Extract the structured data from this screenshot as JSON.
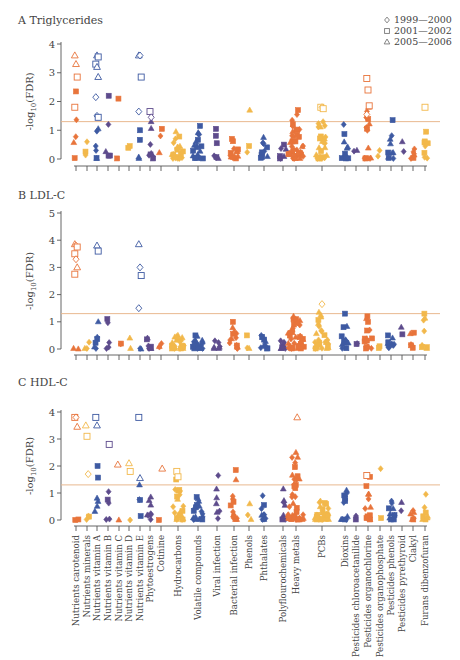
{
  "chart_data": {
    "type": "scatter",
    "subtype": "manhattan-style jitter plot, 3 stacked panels",
    "legend": {
      "position": "top-right",
      "entries": [
        {
          "symbol": "diamond-open",
          "label": "1999—2000"
        },
        {
          "symbol": "square-open",
          "label": "2001—2002"
        },
        {
          "symbol": "triangle-open",
          "label": "2005—2006"
        }
      ],
      "note": "Open symbols = significant (above threshold); filled symbols = non-significant"
    },
    "threshold": {
      "value": 1.3,
      "color": "#e9b98f",
      "label": "FDR 0.05"
    },
    "colors": {
      "orange": "#e8743b",
      "yellow": "#f2b84b",
      "blue": "#3e5aa2",
      "purple": "#5d4b8c"
    },
    "categories": [
      {
        "label": "Nutrients carotenoid",
        "color": "orange"
      },
      {
        "label": "Nutrients minerals",
        "color": "yellow"
      },
      {
        "label": "Nutrients vitamin A",
        "color": "blue"
      },
      {
        "label": "Nutrients vitamin B",
        "color": "purple"
      },
      {
        "label": "Nutrients vitamin C",
        "color": "orange"
      },
      {
        "label": "Nutrients vitamin D",
        "color": "yellow"
      },
      {
        "label": "Nutrients vitamin E",
        "color": "blue"
      },
      {
        "label": "Phytoestrogens",
        "color": "purple"
      },
      {
        "label": "Cotinine",
        "color": "orange"
      },
      {
        "label": "Hydrocarbons",
        "color": "yellow"
      },
      {
        "label": "Volatile compounds",
        "color": "blue"
      },
      {
        "label": "Viral infection",
        "color": "purple"
      },
      {
        "label": "Bacterial infection",
        "color": "orange"
      },
      {
        "label": "Phenols",
        "color": "yellow"
      },
      {
        "label": "Phthalates",
        "color": "blue"
      },
      {
        "label": "Polyflourochemicals",
        "color": "purple"
      },
      {
        "label": "Heavy metals",
        "color": "orange"
      },
      {
        "label": "PCBs",
        "color": "yellow"
      },
      {
        "label": "Dioxins",
        "color": "blue"
      },
      {
        "label": "Pesticides chloroacetanilide",
        "color": "purple"
      },
      {
        "label": "Pesticides organochlorine",
        "color": "orange"
      },
      {
        "label": "Pesticides organophosphate",
        "color": "yellow"
      },
      {
        "label": "Pesticides phenols",
        "color": "blue"
      },
      {
        "label": "Pesticides pyrethyroid",
        "color": "purple"
      },
      {
        "label": "Ciakyl",
        "color": "orange"
      },
      {
        "label": "Furans dibenzofuran",
        "color": "yellow"
      }
    ],
    "panels": [
      {
        "id": "A",
        "title": "Triglycerides",
        "ylabel": "-log10(FDR)",
        "ylim": [
          0,
          4
        ],
        "yticks": [
          0,
          1,
          2,
          3,
          4
        ],
        "significant_points": [
          {
            "cat": 0,
            "y": 3.6,
            "sym": "triangle"
          },
          {
            "cat": 0,
            "y": 3.3,
            "sym": "triangle"
          },
          {
            "cat": 0,
            "y": 2.85,
            "sym": "square"
          },
          {
            "cat": 0,
            "y": 1.8,
            "sym": "square"
          },
          {
            "cat": 2,
            "y": 3.6,
            "sym": "triangle"
          },
          {
            "cat": 2,
            "y": 3.55,
            "sym": "square"
          },
          {
            "cat": 2,
            "y": 3.3,
            "sym": "square"
          },
          {
            "cat": 2,
            "y": 3.2,
            "sym": "triangle"
          },
          {
            "cat": 2,
            "y": 2.85,
            "sym": "triangle"
          },
          {
            "cat": 2,
            "y": 2.15,
            "sym": "diamond"
          },
          {
            "cat": 2,
            "y": 1.5,
            "sym": "diamond"
          },
          {
            "cat": 2,
            "y": 1.45,
            "sym": "square"
          },
          {
            "cat": 6,
            "y": 3.6,
            "sym": "triangle"
          },
          {
            "cat": 6,
            "y": 3.6,
            "sym": "diamond"
          },
          {
            "cat": 6,
            "y": 2.85,
            "sym": "square"
          },
          {
            "cat": 6,
            "y": 1.65,
            "sym": "diamond"
          },
          {
            "cat": 7,
            "y": 1.65,
            "sym": "square"
          },
          {
            "cat": 7,
            "y": 1.45,
            "sym": "diamond"
          },
          {
            "cat": 17,
            "y": 1.8,
            "sym": "square"
          },
          {
            "cat": 17,
            "y": 1.8,
            "sym": "diamond"
          },
          {
            "cat": 17,
            "y": 1.75,
            "sym": "square"
          },
          {
            "cat": 20,
            "y": 2.8,
            "sym": "square"
          },
          {
            "cat": 20,
            "y": 2.4,
            "sym": "square"
          },
          {
            "cat": 20,
            "y": 1.85,
            "sym": "square"
          },
          {
            "cat": 20,
            "y": 1.55,
            "sym": "diamond"
          },
          {
            "cat": 25,
            "y": 1.8,
            "sym": "square"
          }
        ],
        "max_nonsig_by_cat": [
          2.35,
          0.6,
          1.05,
          2.2,
          2.1,
          0.45,
          1.0,
          1.3,
          1.05,
          0.95,
          1.15,
          1.05,
          0.7,
          1.7,
          0.75,
          0.5,
          1.7,
          1.3,
          1.2,
          0.3,
          1.8,
          0.3,
          1.35,
          0.6,
          0.35,
          0.95
        ]
      },
      {
        "id": "B",
        "title": "LDL-C",
        "ylabel": "-log10(FDR)",
        "ylim": [
          0,
          5
        ],
        "yticks": [
          0,
          1,
          2,
          3,
          4,
          5
        ],
        "significant_points": [
          {
            "cat": 0,
            "y": 3.85,
            "sym": "triangle"
          },
          {
            "cat": 0,
            "y": 3.8,
            "sym": "diamond"
          },
          {
            "cat": 0,
            "y": 3.75,
            "sym": "square"
          },
          {
            "cat": 0,
            "y": 3.5,
            "sym": "square"
          },
          {
            "cat": 0,
            "y": 3.3,
            "sym": "diamond"
          },
          {
            "cat": 0,
            "y": 3.0,
            "sym": "triangle"
          },
          {
            "cat": 0,
            "y": 2.75,
            "sym": "square"
          },
          {
            "cat": 2,
            "y": 3.8,
            "sym": "triangle"
          },
          {
            "cat": 2,
            "y": 3.6,
            "sym": "square"
          },
          {
            "cat": 6,
            "y": 3.85,
            "sym": "triangle"
          },
          {
            "cat": 6,
            "y": 3.0,
            "sym": "diamond"
          },
          {
            "cat": 6,
            "y": 2.7,
            "sym": "square"
          },
          {
            "cat": 6,
            "y": 1.5,
            "sym": "diamond"
          },
          {
            "cat": 17,
            "y": 1.65,
            "sym": "diamond"
          }
        ],
        "max_nonsig_by_cat": [
          0,
          0.25,
          1.0,
          1.1,
          0.2,
          0.4,
          0,
          0.4,
          0.2,
          0.5,
          0.5,
          0.3,
          1.0,
          0.5,
          0.5,
          0.3,
          1.2,
          1.35,
          1.3,
          0.2,
          1.2,
          0.1,
          0.5,
          0.8,
          0.6,
          1.3
        ]
      },
      {
        "id": "C",
        "title": "HDL-C",
        "ylabel": "-log10(FDR)",
        "ylim": [
          0,
          4
        ],
        "yticks": [
          0,
          1,
          2,
          3,
          4
        ],
        "significant_points": [
          {
            "cat": 0,
            "y": 3.8,
            "sym": "square"
          },
          {
            "cat": 0,
            "y": 3.8,
            "sym": "diamond"
          },
          {
            "cat": 0,
            "y": 3.45,
            "sym": "triangle"
          },
          {
            "cat": 1,
            "y": 3.5,
            "sym": "triangle"
          },
          {
            "cat": 1,
            "y": 3.1,
            "sym": "square"
          },
          {
            "cat": 1,
            "y": 1.7,
            "sym": "diamond"
          },
          {
            "cat": 2,
            "y": 3.8,
            "sym": "square"
          },
          {
            "cat": 2,
            "y": 3.5,
            "sym": "triangle"
          },
          {
            "cat": 3,
            "y": 2.8,
            "sym": "square"
          },
          {
            "cat": 4,
            "y": 2.05,
            "sym": "triangle"
          },
          {
            "cat": 5,
            "y": 2.1,
            "sym": "triangle"
          },
          {
            "cat": 5,
            "y": 1.8,
            "sym": "square"
          },
          {
            "cat": 6,
            "y": 3.8,
            "sym": "square"
          },
          {
            "cat": 6,
            "y": 1.55,
            "sym": "triangle"
          },
          {
            "cat": 8,
            "y": 1.9,
            "sym": "triangle"
          },
          {
            "cat": 9,
            "y": 1.8,
            "sym": "square"
          },
          {
            "cat": 9,
            "y": 1.6,
            "sym": "square"
          },
          {
            "cat": 16,
            "y": 3.8,
            "sym": "triangle"
          },
          {
            "cat": 20,
            "y": 1.65,
            "sym": "square"
          }
        ],
        "max_nonsig_by_cat": [
          0,
          0.15,
          2.0,
          1.05,
          0,
          0,
          1.3,
          0.85,
          0,
          1.5,
          0.85,
          1.65,
          1.85,
          0.6,
          0.9,
          1.15,
          2.5,
          0.7,
          1.1,
          0.15,
          1.6,
          1.9,
          0.7,
          0.65,
          0.35,
          0.95
        ]
      }
    ],
    "xlabel": "",
    "grid": false
  }
}
